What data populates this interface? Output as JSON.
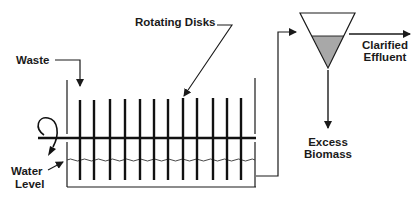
{
  "labels": {
    "rotating_disks": "Rotating Disks",
    "waste": "Waste",
    "water_level_line1": "Water",
    "water_level_line2": "Level",
    "clarified_line1": "Clarified",
    "clarified_line2": "Effluent",
    "excess_line1": "Excess",
    "excess_line2": "Biomass"
  },
  "components": {
    "disk_count": 12,
    "disk_x": [
      80,
      94,
      110,
      125,
      140,
      154,
      168,
      183,
      197,
      213,
      227,
      241
    ],
    "clarifier_fill_color": "#a8a8a8",
    "line_color": "#1a1a1a"
  }
}
